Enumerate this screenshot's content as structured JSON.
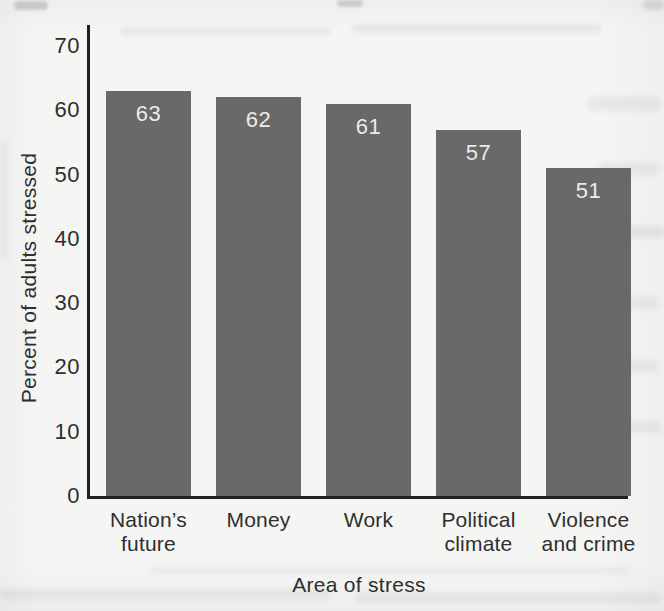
{
  "figure": {
    "paper_color": "#f5f5f3",
    "bar_color": "#696969",
    "axis_color": "#1f1f1f",
    "tick_label_color": "#2e2e2e",
    "bar_value_label_color": "#ebebeb"
  },
  "chart_data": {
    "type": "bar",
    "title": "",
    "xlabel": "Area of stress",
    "ylabel": "Percent of adults stressed",
    "categories": [
      "Nation’s future",
      "Money",
      "Work",
      "Political climate",
      "Violence and crime"
    ],
    "category_label_lines": [
      [
        "Nation’s",
        "future"
      ],
      [
        "Money"
      ],
      [
        "Work"
      ],
      [
        "Political",
        "climate"
      ],
      [
        "Violence",
        "and crime"
      ]
    ],
    "values": [
      63,
      62,
      61,
      57,
      51
    ],
    "ylim": [
      0,
      70
    ],
    "yticks": [
      0,
      10,
      20,
      30,
      40,
      50,
      60,
      70
    ],
    "grid": false,
    "legend_shown": false,
    "bar_value_labels_shown": true
  }
}
